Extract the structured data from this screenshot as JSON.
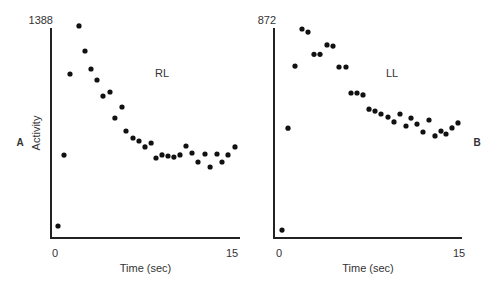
{
  "chart_data": [
    {
      "type": "scatter",
      "panel_label": "A",
      "series_label": "RL",
      "xlabel": "Time (sec)",
      "ylabel": "Activity",
      "y_top_tick": "1388",
      "x_ticks": [
        "0",
        "15"
      ],
      "xlim": [
        0,
        15
      ],
      "ylim": [
        0,
        1388
      ],
      "grid": false,
      "points": [
        [
          0.25,
          79
        ],
        [
          0.76,
          548
        ],
        [
          1.27,
          1084
        ],
        [
          2.03,
          1402
        ],
        [
          2.54,
          1236
        ],
        [
          3.05,
          1117
        ],
        [
          3.56,
          1044
        ],
        [
          4.07,
          938
        ],
        [
          4.66,
          965
        ],
        [
          5.08,
          793
        ],
        [
          5.68,
          866
        ],
        [
          6.02,
          707
        ],
        [
          6.61,
          661
        ],
        [
          7.12,
          641
        ],
        [
          7.63,
          602
        ],
        [
          8.14,
          628
        ],
        [
          8.56,
          529
        ],
        [
          9.07,
          549
        ],
        [
          9.58,
          542
        ],
        [
          10.08,
          535
        ],
        [
          10.59,
          549
        ],
        [
          11.1,
          608
        ],
        [
          11.61,
          562
        ],
        [
          12.12,
          502
        ],
        [
          12.71,
          555
        ],
        [
          13.14,
          469
        ],
        [
          13.73,
          555
        ],
        [
          14.15,
          502
        ],
        [
          14.66,
          549
        ],
        [
          15.25,
          602
        ]
      ]
    },
    {
      "type": "scatter",
      "panel_label": "B",
      "series_label": "LL",
      "xlabel": "Time (sec)",
      "ylabel": "",
      "y_top_tick": "872",
      "x_ticks": [
        "0",
        "15"
      ],
      "xlim": [
        0,
        15
      ],
      "ylim": [
        0,
        872
      ],
      "grid": false,
      "points": [
        [
          0.25,
          33
        ],
        [
          0.75,
          456
        ],
        [
          1.33,
          714
        ],
        [
          1.92,
          868
        ],
        [
          2.42,
          855
        ],
        [
          2.92,
          763
        ],
        [
          3.42,
          763
        ],
        [
          4.0,
          802
        ],
        [
          4.5,
          797
        ],
        [
          5.0,
          710
        ],
        [
          5.58,
          710
        ],
        [
          6.0,
          602
        ],
        [
          6.5,
          602
        ],
        [
          7.0,
          594
        ],
        [
          7.5,
          535
        ],
        [
          8.0,
          527
        ],
        [
          8.5,
          515
        ],
        [
          9.08,
          502
        ],
        [
          9.58,
          482
        ],
        [
          10.08,
          515
        ],
        [
          10.58,
          465
        ],
        [
          11.0,
          498
        ],
        [
          11.5,
          473
        ],
        [
          12.0,
          440
        ],
        [
          12.5,
          490
        ],
        [
          13.0,
          424
        ],
        [
          13.5,
          444
        ],
        [
          13.92,
          432
        ],
        [
          14.42,
          457
        ],
        [
          14.92,
          478
        ]
      ]
    }
  ]
}
